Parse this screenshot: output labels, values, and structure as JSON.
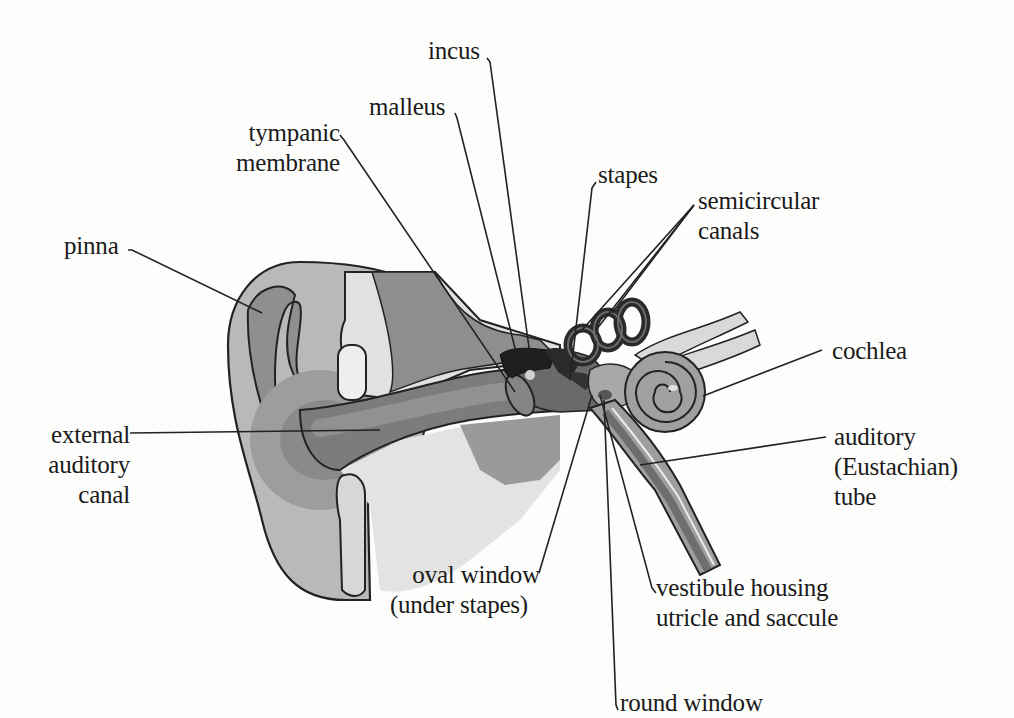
{
  "diagram": {
    "title": "",
    "colors": {
      "background": "#fdfdfc",
      "outline": "#222222",
      "pinna_light": "#b8b8b8",
      "pinna_dark": "#8e8e8e",
      "canal": "#7a7a7a",
      "bone_light": "#e2e2e2",
      "bone_dark": "#8a8a8a",
      "ossicles": "#1e1e1e",
      "cochlea": "#9a9a9a",
      "leader_line": "#222222"
    },
    "labels": [
      {
        "id": "incus",
        "lines": [
          "incus"
        ]
      },
      {
        "id": "malleus",
        "lines": [
          "malleus"
        ]
      },
      {
        "id": "tympanic-membrane",
        "lines": [
          "tympanic",
          "membrane"
        ]
      },
      {
        "id": "stapes",
        "lines": [
          "stapes"
        ]
      },
      {
        "id": "semicircular-canals",
        "lines": [
          "semicircular",
          "canals"
        ]
      },
      {
        "id": "pinna",
        "lines": [
          "pinna"
        ]
      },
      {
        "id": "cochlea",
        "lines": [
          "cochlea"
        ]
      },
      {
        "id": "external-auditory-canal",
        "lines": [
          "external",
          "auditory",
          "canal"
        ]
      },
      {
        "id": "auditory-tube",
        "lines": [
          "auditory",
          "(Eustachian)",
          "tube"
        ]
      },
      {
        "id": "oval-window",
        "lines": [
          "oval window",
          "(under stapes)"
        ]
      },
      {
        "id": "vestibule",
        "lines": [
          "vestibule housing",
          "utricle and saccule"
        ]
      },
      {
        "id": "round-window",
        "lines": [
          "round window"
        ]
      }
    ]
  }
}
